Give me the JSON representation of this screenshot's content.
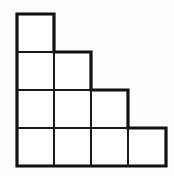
{
  "figure": {
    "name": "staircase-polyomino",
    "background_color": "#fdfdfd",
    "cell_fill_color": "#ffffff",
    "outline_color": "#111111",
    "grid_line_color": "#1a1a1a",
    "outline_stroke_width": 3.2,
    "grid_stroke_width": 2,
    "origin_x": 17,
    "origin_y": 14,
    "cell_size": 37,
    "columns": 4,
    "rows": 4,
    "total_cells": 10,
    "row_cell_counts": [
      1,
      2,
      3,
      4
    ],
    "outline_points": "17,14 54,14 54,52 91,52 91,90 128,90 128,128 166,128 166,166 17,166",
    "interior_lines": [
      {
        "name": "horizontal-row1-row2",
        "x1": 17,
        "y1": 52,
        "x2": 54,
        "y2": 52
      },
      {
        "name": "horizontal-row2-row3",
        "x1": 17,
        "y1": 90,
        "x2": 91,
        "y2": 90
      },
      {
        "name": "horizontal-row3-row4",
        "x1": 17,
        "y1": 128,
        "x2": 128,
        "y2": 128
      },
      {
        "name": "vertical-col1-col2",
        "x1": 54,
        "y1": 52,
        "x2": 54,
        "y2": 166
      },
      {
        "name": "vertical-col2-col3",
        "x1": 91,
        "y1": 90,
        "x2": 91,
        "y2": 166
      },
      {
        "name": "vertical-col3-col4",
        "x1": 128,
        "y1": 128,
        "x2": 128,
        "y2": 166
      }
    ],
    "cells": [
      {
        "name": "cell-r1-c1",
        "row": 1,
        "col": 1,
        "x": 17,
        "y": 14
      },
      {
        "name": "cell-r2-c1",
        "row": 2,
        "col": 1,
        "x": 17,
        "y": 52
      },
      {
        "name": "cell-r2-c2",
        "row": 2,
        "col": 2,
        "x": 54,
        "y": 52
      },
      {
        "name": "cell-r3-c1",
        "row": 3,
        "col": 1,
        "x": 17,
        "y": 90
      },
      {
        "name": "cell-r3-c2",
        "row": 3,
        "col": 2,
        "x": 54,
        "y": 90
      },
      {
        "name": "cell-r3-c3",
        "row": 3,
        "col": 3,
        "x": 91,
        "y": 90
      },
      {
        "name": "cell-r4-c1",
        "row": 4,
        "col": 1,
        "x": 17,
        "y": 128
      },
      {
        "name": "cell-r4-c2",
        "row": 4,
        "col": 2,
        "x": 54,
        "y": 128
      },
      {
        "name": "cell-r4-c3",
        "row": 4,
        "col": 3,
        "x": 91,
        "y": 128
      },
      {
        "name": "cell-r4-c4",
        "row": 4,
        "col": 4,
        "x": 128,
        "y": 128
      }
    ]
  }
}
